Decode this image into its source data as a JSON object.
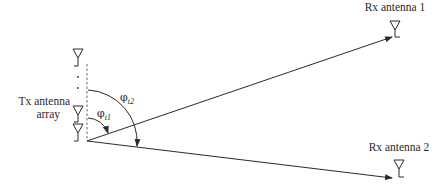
{
  "diagram": {
    "tx_label_line1": "Tx antenna",
    "tx_label_line2": "array",
    "rx1_label": "Rx antenna 1",
    "rx2_label": "Rx antenna 2",
    "angle1_symbol": "φ",
    "angle1_sub": "t1",
    "angle2_symbol": "φ",
    "angle2_sub": "t2",
    "array_dots": "· ·",
    "colors": {
      "line": "#2a2a2a",
      "background": "#ffffff"
    }
  }
}
